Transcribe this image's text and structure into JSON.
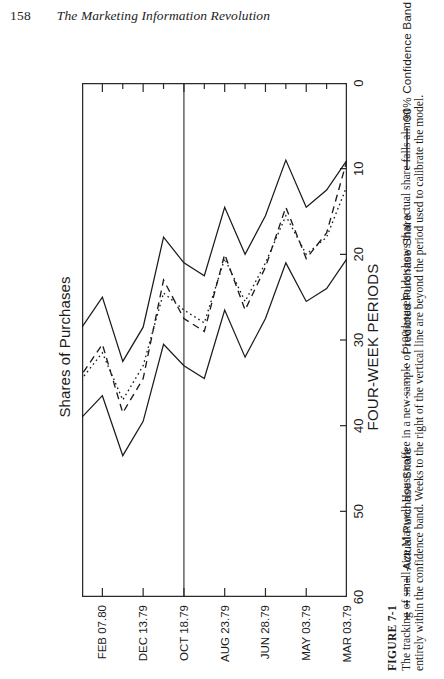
{
  "page": {
    "number": "158",
    "book_title": "The Marketing Information Revolution"
  },
  "figure": {
    "label": "FIGURE 7-1",
    "caption": "The tracking of small-size Maxwell House coffee in a new sample of 100 households shows that actual share falls almost entirely within the confidence band. Weeks to the right of the vertical line are beyond the period used to calibrate the model."
  },
  "chart_data": {
    "type": "line",
    "title": "Shares of Purchases",
    "xlabel": "FOUR-WEEK PERIODS",
    "ylabel": "Shares of Purchases",
    "ylim": [
      0,
      60
    ],
    "yticks": [
      0,
      10,
      20,
      30,
      40,
      50,
      60
    ],
    "grid": false,
    "legend_position": "bottom",
    "x_tick_labels": [
      "MAR 03.79",
      "MAY 03.79",
      "JUN 28.79",
      "AUG 23.79",
      "OCT 18.79",
      "DEC 13.79",
      "FEB 07.80"
    ],
    "x_tick_indices": [
      0,
      2,
      4,
      6,
      8,
      10,
      12
    ],
    "x_index_count": 14,
    "annotations": [
      {
        "name": "calibration-divider",
        "type": "vline",
        "x_index": 8,
        "note": "Weeks to the right of this line are beyond the calibration period"
      }
    ],
    "series": [
      {
        "name": "Actual Purchase Share",
        "style": "dashed",
        "color": "#1b1b1b",
        "values": [
          9.0,
          17.5,
          20.5,
          14.5,
          21.5,
          26.5,
          20.0,
          29.0,
          27.5,
          23.0,
          34.5,
          38.5,
          30.5,
          34.0
        ]
      },
      {
        "name": "Predicted Purchase Share",
        "style": "dotted",
        "color": "#1b1b1b",
        "values": [
          12.0,
          18.0,
          20.0,
          15.5,
          21.0,
          25.5,
          20.5,
          28.0,
          26.5,
          24.5,
          33.0,
          37.0,
          31.5,
          34.5
        ]
      },
      {
        "name": "90% Confidence Band",
        "style": "solid",
        "color": "#1b1b1b",
        "is_band": true,
        "upper": [
          20.5,
          24.0,
          25.5,
          21.0,
          27.5,
          32.0,
          26.5,
          34.5,
          33.0,
          30.5,
          39.5,
          43.5,
          36.5,
          39.0
        ],
        "lower": [
          9.0,
          12.5,
          14.5,
          9.0,
          15.5,
          20.0,
          14.5,
          22.5,
          21.0,
          18.0,
          28.5,
          32.5,
          25.0,
          28.5
        ]
      }
    ]
  },
  "legend": [
    {
      "label": "Actual Purchase Share",
      "style": "dashed"
    },
    {
      "label": "Predicted Purchase Share",
      "style": "dotted"
    },
    {
      "label": "90% Confidence Band",
      "style": "solid"
    }
  ]
}
